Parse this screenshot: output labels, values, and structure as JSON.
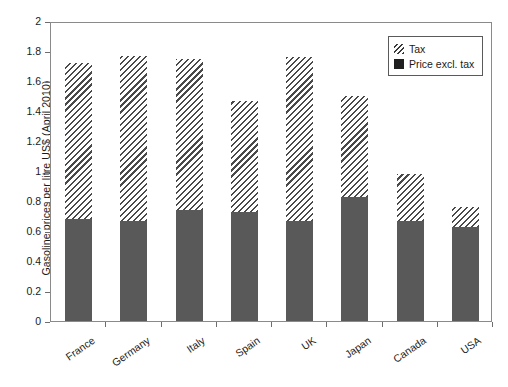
{
  "chart_data": {
    "type": "bar",
    "stacked": true,
    "title": "",
    "xlabel": "",
    "ylabel": "Gasoline prices per litre US$ (April 2010)",
    "ylim": [
      0,
      2
    ],
    "ytick_labels": [
      "2",
      "1.8",
      "1.6",
      "1.4",
      "1.2",
      "1",
      "0.8",
      "0.6",
      "0.4",
      "0.2",
      "0"
    ],
    "ytick_values": [
      2,
      1.8,
      1.6,
      1.4,
      1.2,
      1,
      0.8,
      0.6,
      0.4,
      0.2,
      0
    ],
    "grid": false,
    "legend_position": "top-right",
    "categories": [
      "France",
      "Germany",
      "Italy",
      "Spain",
      "UK",
      "Japan",
      "Canada",
      "USA"
    ],
    "series": [
      {
        "name": "Price excl. tax",
        "color": "#595959",
        "fill": "solid",
        "values": [
          0.68,
          0.67,
          0.74,
          0.73,
          0.67,
          0.83,
          0.67,
          0.63
        ]
      },
      {
        "name": "Tax",
        "color": "#4a4a4a",
        "fill": "hatched",
        "values": [
          1.04,
          1.1,
          1.01,
          0.74,
          1.09,
          0.67,
          0.31,
          0.13
        ]
      }
    ],
    "totals": [
      1.72,
      1.77,
      1.75,
      1.47,
      1.76,
      1.5,
      0.98,
      0.76
    ]
  },
  "legend": {
    "items": [
      {
        "label": "Tax",
        "swatch": "hatched-swatch-icon"
      },
      {
        "label": "Price excl. tax",
        "swatch": "solid-swatch-icon"
      }
    ]
  }
}
